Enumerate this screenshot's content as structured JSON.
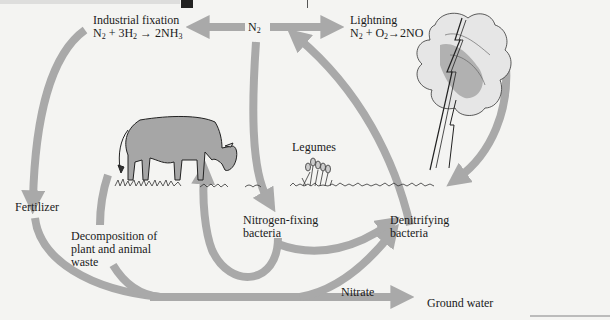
{
  "diagram": {
    "arrow_color": "#a9a9a9",
    "nodes": {
      "n2": {
        "label": "N",
        "sub": "2"
      },
      "industrial_fixation": {
        "title": "Industrial fixation",
        "equation": {
          "parts": [
            "N",
            "2",
            " + 3H",
            "2",
            " → 2NH",
            "3"
          ]
        }
      },
      "lightning": {
        "title": "Lightning",
        "equation": {
          "parts": [
            "N",
            "2",
            " + O",
            "2",
            "→2NO"
          ]
        }
      },
      "fertilizer": "Fertilizer",
      "decomposition": [
        "Decomposition of",
        "plant and animal",
        "waste"
      ],
      "legumes": "Legumes",
      "nitrogen_fixing": [
        "Nitrogen-fixing",
        "bacteria"
      ],
      "denitrifying": [
        "Denitrifying",
        "bacteria"
      ],
      "nitrate": "Nitrate",
      "ground_water": "Ground water"
    },
    "illustrations": [
      "cow-grazing",
      "legume-plants",
      "storm-cloud-lightning",
      "grass-ground-line"
    ]
  }
}
